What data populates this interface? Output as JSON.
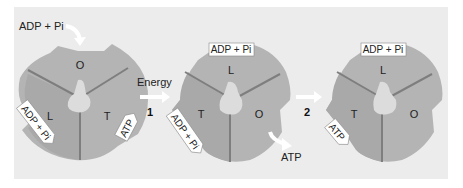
{
  "diagram": {
    "colors": {
      "background": "#ececec",
      "disk": "#b4b4b4",
      "disk_dark": "#a8a8a8",
      "divider": "#7e7e7e",
      "center": "#dcdcdc",
      "tag_fill": "#ffffff",
      "arrow": "#ffffff"
    },
    "input_label": "ADP + Pi",
    "energy_label": "Energy",
    "output_label": "ATP",
    "steps": [
      {
        "number": "1"
      },
      {
        "number": "2"
      }
    ],
    "states": [
      {
        "sections": {
          "top": "O",
          "left": "L",
          "right": "T"
        },
        "tags": {
          "left": "ADP + Pi",
          "right": "ATP"
        }
      },
      {
        "sections": {
          "top": "L",
          "left": "T",
          "right": "O"
        },
        "tags": {
          "top": "ADP + Pi",
          "left": "ADP + Pi"
        }
      },
      {
        "sections": {
          "top": "L",
          "left": "T",
          "right": "O"
        },
        "tags": {
          "top": "ADP + Pi",
          "left": "ATP"
        }
      }
    ]
  }
}
